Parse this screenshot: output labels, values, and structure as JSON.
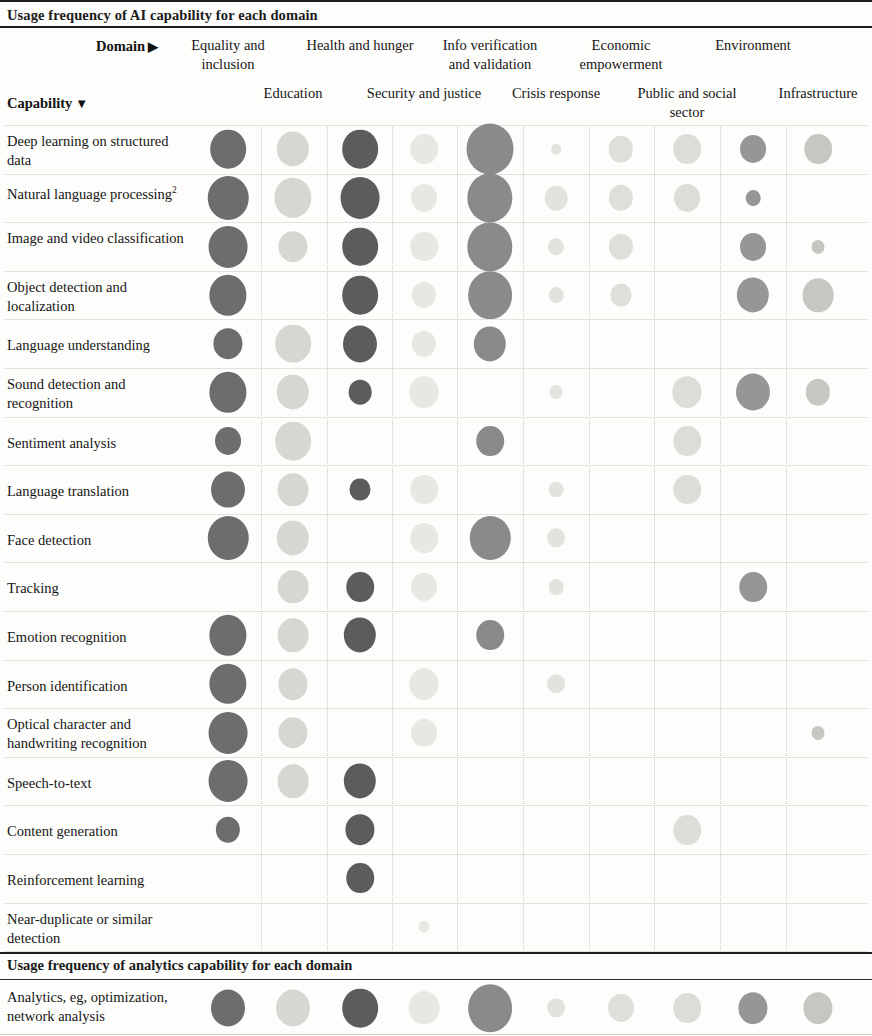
{
  "header": {
    "title": "Usage frequency of AI capability for each domain",
    "domain_label": "Domain",
    "domain_arrow": "▶",
    "capability_label": "Capability",
    "capability_arrow": "▼"
  },
  "analytics_section": {
    "title": "Usage frequency of analytics capability for each domain",
    "row_label": "Analytics, eg, optimization, network analysis"
  },
  "chart_data": {
    "type": "heatmap",
    "title": "Usage frequency of AI capability for each domain",
    "xlabel": "Domain",
    "ylabel": "Capability",
    "grid": true,
    "legend": null,
    "note": "Bubble area encodes usage frequency; shade encodes domain column group.",
    "columns": [
      {
        "label": "Equality and inclusion",
        "row": "top",
        "cx": 228,
        "shade": "#6d6d6d"
      },
      {
        "label": "Education",
        "row": "bottom",
        "cx": 293,
        "shade": "#d6d6d2"
      },
      {
        "label": "Health and hunger",
        "row": "top",
        "cx": 360,
        "shade": "#5c5c5c"
      },
      {
        "label": "Security and justice",
        "row": "bottom",
        "cx": 424,
        "shade": "#e7e7e3"
      },
      {
        "label": "Info verification and validation",
        "row": "top",
        "cx": 490,
        "shade": "#8a8a8a"
      },
      {
        "label": "Crisis response",
        "row": "bottom",
        "cx": 556,
        "shade": "#e2e2de"
      },
      {
        "label": "Economic empowerment",
        "row": "top",
        "cx": 621,
        "shade": "#dededa"
      },
      {
        "label": "Public and social sector",
        "row": "bottom",
        "cx": 687,
        "shade": "#dcdcd8"
      },
      {
        "label": "Environment",
        "row": "top",
        "cx": 753,
        "shade": "#969696"
      },
      {
        "label": "Infrastructure",
        "row": "bottom",
        "cx": 818,
        "shade": "#c6c6c2"
      }
    ],
    "rows": [
      {
        "label": "Deep learning on structured data",
        "values": [
          22,
          20,
          22,
          17,
          29,
          6,
          15,
          17,
          16,
          17
        ]
      },
      {
        "label": "Natural language processing",
        "sup": "2",
        "values": [
          25,
          23,
          24,
          16,
          28,
          14,
          15,
          16,
          9,
          0
        ]
      },
      {
        "label": "Image and video classification",
        "values": [
          24,
          18,
          22,
          17,
          28,
          10,
          15,
          0,
          16,
          8
        ]
      },
      {
        "label": "Object detection and localization",
        "values": [
          23,
          0,
          22,
          15,
          27,
          9,
          13,
          0,
          20,
          19
        ]
      },
      {
        "label": "Language understanding",
        "values": [
          18,
          22,
          21,
          15,
          20,
          0,
          0,
          0,
          0,
          0
        ]
      },
      {
        "label": "Sound detection and recognition",
        "values": [
          23,
          20,
          14,
          18,
          0,
          8,
          0,
          18,
          21,
          15
        ]
      },
      {
        "label": "Sentiment analysis",
        "values": [
          16,
          22,
          0,
          0,
          17,
          0,
          0,
          17,
          0,
          0
        ]
      },
      {
        "label": "Language translation",
        "values": [
          21,
          19,
          13,
          17,
          0,
          9,
          0,
          17,
          0,
          0
        ]
      },
      {
        "label": "Face detection",
        "values": [
          25,
          20,
          0,
          17,
          25,
          11,
          0,
          0,
          0,
          0
        ]
      },
      {
        "label": "Tracking",
        "values": [
          0,
          19,
          17,
          16,
          0,
          9,
          0,
          0,
          17,
          0
        ]
      },
      {
        "label": "Emotion recognition",
        "values": [
          23,
          19,
          20,
          0,
          17,
          0,
          0,
          0,
          0,
          0
        ]
      },
      {
        "label": "Person identification",
        "values": [
          23,
          18,
          0,
          18,
          0,
          11,
          0,
          0,
          0,
          0
        ]
      },
      {
        "label": "Optical character and handwriting recognition",
        "values": [
          24,
          18,
          0,
          16,
          0,
          0,
          0,
          0,
          0,
          8
        ]
      },
      {
        "label": "Speech-to-text",
        "values": [
          24,
          19,
          20,
          0,
          0,
          0,
          0,
          0,
          0,
          0
        ]
      },
      {
        "label": "Content generation",
        "values": [
          15,
          0,
          18,
          0,
          0,
          0,
          0,
          17,
          0,
          0
        ]
      },
      {
        "label": "Reinforcement learning",
        "values": [
          0,
          0,
          17,
          0,
          0,
          0,
          0,
          0,
          0,
          0
        ]
      },
      {
        "label": "Near-duplicate or similar detection",
        "values": [
          0,
          0,
          0,
          7,
          0,
          0,
          0,
          0,
          0,
          0
        ]
      }
    ],
    "analytics_row": {
      "label": "Analytics, eg, optimization, network analysis",
      "values": [
        21,
        21,
        22,
        19,
        27,
        11,
        16,
        17,
        18,
        18
      ]
    }
  }
}
